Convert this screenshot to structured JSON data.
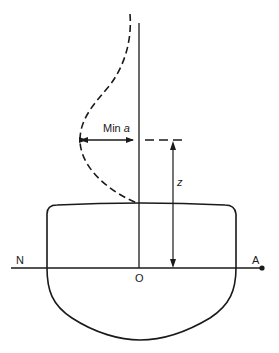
{
  "diagram": {
    "title": "",
    "labels": {
      "min_a_prefix": "Min ",
      "min_a_var": "a",
      "z": "z",
      "origin": "O",
      "left_end": "N",
      "right_end": "A"
    },
    "elements": [
      {
        "name": "hull-section",
        "kind": "closed-outline"
      },
      {
        "name": "centerline",
        "kind": "vertical-line"
      },
      {
        "name": "neutral-axis",
        "kind": "horizontal-line",
        "from": "N",
        "to": "A"
      },
      {
        "name": "dashed-profile-curve",
        "kind": "dashed-curve"
      },
      {
        "name": "min-a-dimension",
        "kind": "double-arrow",
        "label": "Min a"
      },
      {
        "name": "z-dimension",
        "kind": "double-arrow",
        "label": "z"
      }
    ],
    "colors": {
      "ink": "#1a1a1a",
      "background": "#ffffff"
    }
  }
}
